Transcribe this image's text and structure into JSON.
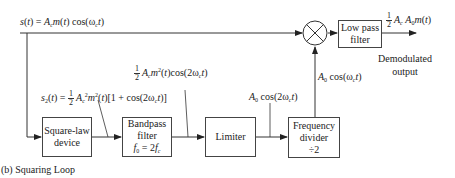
{
  "diagram": {
    "caption": "(b) Squaring Loop",
    "input_signal": {
      "lhs": "s(t)",
      "rhs": "= A_c m(t) cos(ω_c t)"
    },
    "blocks": {
      "square_law": {
        "line1": "Square-law",
        "line2": "device"
      },
      "bandpass": {
        "line1": "Bandpass",
        "line2": "filter",
        "line3": "f0 = 2fc"
      },
      "limiter": {
        "line1": "Limiter"
      },
      "freq_divider": {
        "line1": "Frequency",
        "line2": "divider",
        "line3": "÷2"
      },
      "lowpass": {
        "line1": "Low pass",
        "line2": "filter"
      }
    },
    "signals": {
      "s2": "s2(t) = 1/2 Ac² m²(t)[1 + cos(2ωc t)]",
      "bpf_out": "1/2 Ac m²(t)cos(2ωc t)",
      "limiter_out": "A0 cos(2ωc t)",
      "divider_out": "A0 cos(ωc t)",
      "output": "1/2 Ac A0 m(t)"
    },
    "output_label": {
      "line1": "Demodulated",
      "line2": "output"
    },
    "mixer_symbol": "⊗"
  }
}
